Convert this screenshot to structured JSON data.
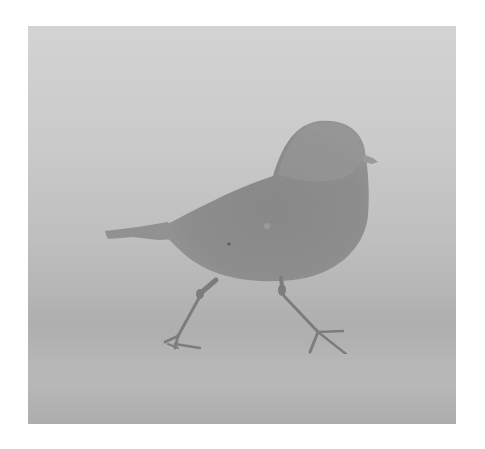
{
  "image": {
    "subject": "bird walking",
    "style": "grayscale photograph",
    "alt": "Grayscale image of a small plump bird silhouette walking left-to-right on a soft gray gradient background, framed by a white border"
  },
  "colors": {
    "border": "#ffffff",
    "background_top": "#d3d3d3",
    "background_bottom": "#b2b2b2",
    "bird_body": "#8e8e8e",
    "bird_head": "#9a9a9a",
    "bird_legs": "#7e7e7e"
  }
}
